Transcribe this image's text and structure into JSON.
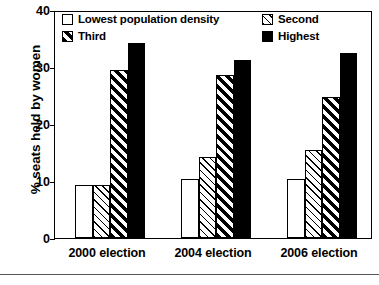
{
  "chart_data": {
    "type": "bar",
    "title": "",
    "xlabel": "",
    "ylabel": "% seats held by women",
    "categories": [
      "2000 election",
      "2004 election",
      "2006 election"
    ],
    "series": [
      {
        "name": "Lowest population density",
        "fill": "empty",
        "values": [
          9.3,
          10.3,
          10.3
        ]
      },
      {
        "name": "Second",
        "fill": "light-hatch",
        "values": [
          9.3,
          14.3,
          15.5
        ]
      },
      {
        "name": "Third",
        "fill": "heavy-hatch",
        "values": [
          29.4,
          28.6,
          24.7
        ]
      },
      {
        "name": "Highest",
        "fill": "solid",
        "values": [
          34.2,
          31.2,
          32.4
        ]
      }
    ],
    "ylim": [
      0,
      40
    ],
    "yticks": [
      0,
      10,
      20,
      30,
      40
    ],
    "ytick_labels": [
      "0",
      "10",
      "20",
      "30",
      "40"
    ],
    "grid": false,
    "legend_position": "inside-top-left",
    "colors": {
      "line": "#000000",
      "background": "#ffffff"
    }
  }
}
